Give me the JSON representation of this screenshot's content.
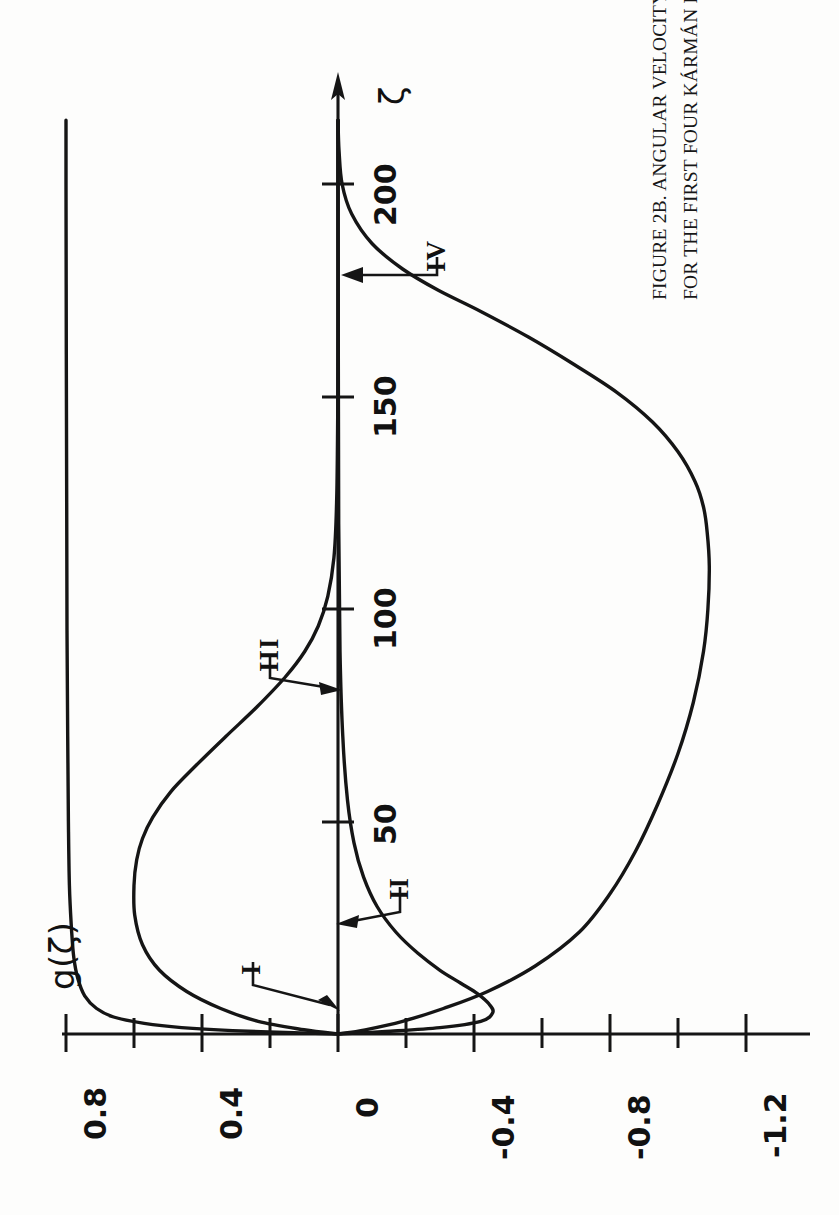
{
  "figure": {
    "caption_line1": "FIGURE 2B. ANGULAR VELOCITY AS A FUNCTION OF",
    "caption_symbol": "ζ",
    "caption_line2": "FOR THE FIRST FOUR KÁRMÁN FLOWS.",
    "ylabel": "g(ζ)",
    "xlabel": "ζ",
    "ink_color": "#151515",
    "paper_color": "#fdfdfc"
  },
  "chart_data": {
    "type": "line",
    "title": "FIGURE 2B. ANGULAR VELOCITY AS A FUNCTION OF ζ FOR THE FIRST FOUR KÁRMÁN FLOWS.",
    "orientation": "rotated-90-ccw",
    "xlabel": "ζ",
    "ylabel": "g(ζ)",
    "xlim": [
      0,
      215
    ],
    "ylim": [
      -1.2,
      0.8
    ],
    "grid": false,
    "legend": "inline-arrow-annotations",
    "x_ticks": [
      0,
      50,
      100,
      150,
      200
    ],
    "x_tick_labels": [
      "",
      "50",
      "100",
      "150",
      "200"
    ],
    "y_ticks": [
      0.8,
      0.6,
      0.4,
      0.2,
      0,
      -0.2,
      -0.4,
      -0.6,
      -0.8,
      -1.0,
      -1.2
    ],
    "y_tick_labels": [
      "0.8",
      "",
      "0.4",
      "",
      "0",
      "",
      "-0.4",
      "",
      "-0.8",
      "",
      "-1.2"
    ],
    "annotations": [
      {
        "label": "I",
        "points_to_zeta": 1.5,
        "points_to_g": 0.02
      },
      {
        "label": "II",
        "points_to_zeta": 37,
        "points_to_g": 0.01
      },
      {
        "label": "III",
        "points_to_zeta": 88,
        "points_to_g": 0.0
      },
      {
        "label": "IV",
        "points_to_zeta": 178,
        "points_to_g": 0.0
      }
    ],
    "series": [
      {
        "name": "I",
        "x": [
          0,
          0.3,
          0.8,
          1.5,
          2.5,
          4,
          6,
          9,
          13,
          18,
          25,
          35,
          50,
          70,
          95,
          125,
          160,
          200,
          215
        ],
        "y": [
          0.0,
          0.13,
          0.31,
          0.46,
          0.57,
          0.66,
          0.71,
          0.745,
          0.765,
          0.777,
          0.784,
          0.79,
          0.793,
          0.795,
          0.797,
          0.798,
          0.799,
          0.8,
          0.8
        ]
      },
      {
        "name": "II",
        "x": [
          0,
          0.6,
          1.5,
          3,
          5,
          7,
          9.5,
          12,
          15,
          19,
          24,
          30,
          37,
          45,
          55,
          70,
          90,
          120,
          160,
          200,
          215
        ],
        "y": [
          0.0,
          -0.14,
          -0.3,
          -0.42,
          -0.455,
          -0.445,
          -0.41,
          -0.36,
          -0.3,
          -0.235,
          -0.17,
          -0.115,
          -0.075,
          -0.047,
          -0.028,
          -0.014,
          -0.006,
          -0.002,
          -0.001,
          0.0,
          0.0
        ]
      },
      {
        "name": "III",
        "x": [
          0,
          1,
          3,
          6,
          10,
          15,
          21,
          28,
          35,
          41,
          46,
          51,
          57,
          63,
          70,
          77,
          84,
          90,
          96,
          103,
          112,
          125,
          145,
          170,
          200,
          215
        ],
        "y": [
          0.0,
          0.1,
          0.235,
          0.345,
          0.445,
          0.525,
          0.575,
          0.598,
          0.6,
          0.592,
          0.575,
          0.545,
          0.492,
          0.42,
          0.33,
          0.238,
          0.155,
          0.098,
          0.058,
          0.03,
          0.012,
          0.004,
          0.001,
          0.0,
          0.0,
          0.0
        ]
      },
      {
        "name": "IV",
        "x": [
          0,
          1,
          3,
          6,
          10,
          16,
          24,
          33,
          43,
          54,
          66,
          78,
          90,
          100,
          110,
          118,
          124,
          130,
          137,
          144,
          151,
          158,
          164,
          170,
          175,
          180,
          186,
          193,
          200,
          208,
          215
        ],
        "y": [
          0.0,
          -0.08,
          -0.19,
          -0.31,
          -0.44,
          -0.58,
          -0.71,
          -0.8,
          -0.875,
          -0.94,
          -1.0,
          -1.045,
          -1.075,
          -1.088,
          -1.092,
          -1.086,
          -1.075,
          -1.05,
          -1.0,
          -0.925,
          -0.82,
          -0.685,
          -0.56,
          -0.42,
          -0.295,
          -0.19,
          -0.1,
          -0.04,
          -0.012,
          -0.003,
          0.0
        ]
      }
    ]
  }
}
